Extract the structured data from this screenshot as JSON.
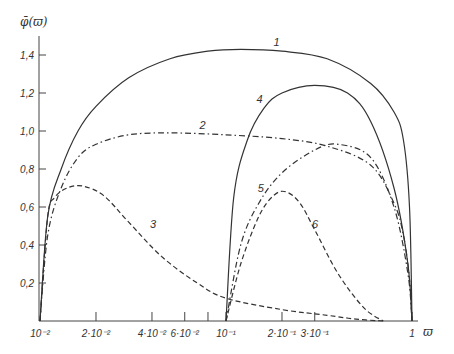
{
  "chart_data": {
    "type": "line",
    "title": "",
    "xlabel": "ϖ",
    "ylabel": "φ̄(ϖ)",
    "xscale": "log",
    "xlim": [
      0.01,
      1
    ],
    "ylim": [
      0,
      1.5
    ],
    "grid": false,
    "legend": "inline numeric labels 1–6",
    "x_ticks": [
      {
        "value": 0.01,
        "label": "10⁻²"
      },
      {
        "value": 0.02,
        "label": "2·10⁻²"
      },
      {
        "value": 0.04,
        "label": "4·10⁻²"
      },
      {
        "value": 0.06,
        "label": "6·10⁻²"
      },
      {
        "value": 0.08,
        "label": ""
      },
      {
        "value": 0.1,
        "label": "10⁻¹"
      },
      {
        "value": 0.2,
        "label": "2·10⁻¹"
      },
      {
        "value": 0.3,
        "label": "3·10⁻¹"
      },
      {
        "value": 1,
        "label": "1"
      }
    ],
    "y_ticks": [
      {
        "value": 0.2,
        "label": "0,2"
      },
      {
        "value": 0.4,
        "label": "0,4"
      },
      {
        "value": 0.6,
        "label": "0,6"
      },
      {
        "value": 0.8,
        "label": "0,8"
      },
      {
        "value": 1.0,
        "label": "1,0"
      },
      {
        "value": 1.2,
        "label": "1,2"
      },
      {
        "value": 1.4,
        "label": "1,4"
      }
    ],
    "series": [
      {
        "name": "1",
        "style": "solid",
        "x": [
          0.01,
          0.011,
          0.013,
          0.016,
          0.02,
          0.03,
          0.05,
          0.08,
          0.12,
          0.2,
          0.35,
          0.6,
          0.8,
          0.9,
          0.97,
          1.0
        ],
        "y": [
          0.0,
          0.55,
          0.8,
          1.0,
          1.13,
          1.28,
          1.38,
          1.42,
          1.43,
          1.42,
          1.38,
          1.25,
          1.1,
          0.95,
          0.6,
          0.0
        ]
      },
      {
        "name": "2",
        "style": "dash-dot",
        "x": [
          0.01,
          0.011,
          0.013,
          0.016,
          0.02,
          0.03,
          0.05,
          0.1,
          0.2,
          0.35,
          0.6,
          0.8,
          0.9,
          0.97,
          1.0
        ],
        "y": [
          0.0,
          0.45,
          0.7,
          0.86,
          0.93,
          0.98,
          0.99,
          0.98,
          0.96,
          0.92,
          0.82,
          0.62,
          0.45,
          0.22,
          0.0
        ]
      },
      {
        "name": "3",
        "style": "dashed",
        "x": [
          0.01,
          0.011,
          0.012,
          0.014,
          0.017,
          0.022,
          0.03,
          0.045,
          0.07,
          0.1,
          0.2,
          0.35,
          0.5,
          0.7
        ],
        "y": [
          0.0,
          0.55,
          0.65,
          0.7,
          0.71,
          0.66,
          0.52,
          0.34,
          0.2,
          0.12,
          0.06,
          0.03,
          0.01,
          0.0
        ]
      },
      {
        "name": "4",
        "style": "solid",
        "x": [
          0.1,
          0.11,
          0.13,
          0.16,
          0.2,
          0.3,
          0.45,
          0.6,
          0.8,
          0.95,
          1.0
        ],
        "y": [
          0.0,
          0.65,
          0.95,
          1.12,
          1.2,
          1.24,
          1.2,
          1.05,
          0.7,
          0.3,
          0.0
        ]
      },
      {
        "name": "5",
        "style": "dash-dot",
        "x": [
          0.1,
          0.12,
          0.15,
          0.2,
          0.3,
          0.4,
          0.6,
          0.8,
          0.95,
          1.0
        ],
        "y": [
          0.0,
          0.4,
          0.62,
          0.78,
          0.9,
          0.93,
          0.86,
          0.6,
          0.25,
          0.0
        ]
      },
      {
        "name": "6",
        "style": "dashed",
        "x": [
          0.1,
          0.12,
          0.15,
          0.18,
          0.21,
          0.25,
          0.3,
          0.4,
          0.55,
          0.7
        ],
        "y": [
          0.0,
          0.3,
          0.55,
          0.66,
          0.68,
          0.62,
          0.48,
          0.25,
          0.07,
          0.0
        ]
      }
    ],
    "annotations": [
      {
        "text": "1",
        "x": 0.18,
        "y": 1.45
      },
      {
        "text": "2",
        "x": 0.072,
        "y": 1.01
      },
      {
        "text": "3",
        "x": 0.039,
        "y": 0.49
      },
      {
        "text": "4",
        "x": 0.146,
        "y": 1.15
      },
      {
        "text": "5",
        "x": 0.148,
        "y": 0.68
      },
      {
        "text": "6",
        "x": 0.29,
        "y": 0.49
      }
    ]
  }
}
